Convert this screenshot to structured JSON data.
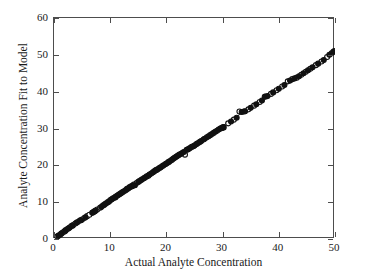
{
  "chart_data": {
    "type": "scatter",
    "title": "",
    "xlabel": "Actual Analyte Concentration",
    "ylabel": "Analyte Concentration Fit to Model",
    "xlim": [
      0,
      50
    ],
    "ylim": [
      0,
      60
    ],
    "xticks": [
      0,
      10,
      20,
      30,
      40,
      50
    ],
    "yticks": [
      0,
      10,
      20,
      30,
      40,
      50,
      60
    ],
    "xtick_labels": [
      "0",
      "10",
      "20",
      "30",
      "40",
      "50"
    ],
    "ytick_labels": [
      "0",
      "10",
      "20",
      "30",
      "40",
      "50",
      "60"
    ],
    "grid": false,
    "legend": "none",
    "tick_direction": "in",
    "frame": "full-box",
    "marker_styles": {
      "open": {
        "shape": "circle",
        "fill": "#ffffff",
        "edge": "#111111",
        "size": 5.0
      },
      "filled": {
        "shape": "circle",
        "fill": "#111111",
        "edge": "#111111",
        "size": 5.0
      }
    },
    "fit_line": {
      "label": "identity fit line",
      "color": "#1a1a1a",
      "width": 0.9,
      "x": [
        0.0,
        50.0
      ],
      "y": [
        0.3,
        51.0
      ]
    },
    "series": [
      {
        "name": "open-circle-observations",
        "marker": "open",
        "points": [
          [
            0.6,
            0.7
          ],
          [
            0.9,
            1.0
          ],
          [
            1.2,
            1.3
          ],
          [
            1.5,
            1.7
          ],
          [
            1.8,
            2.0
          ],
          [
            2.1,
            2.4
          ],
          [
            2.4,
            2.7
          ],
          [
            2.8,
            3.1
          ],
          [
            3.1,
            3.5
          ],
          [
            3.4,
            3.8
          ],
          [
            3.8,
            4.2
          ],
          [
            4.2,
            4.6
          ],
          [
            4.6,
            5.0
          ],
          [
            5.0,
            5.3
          ],
          [
            5.4,
            5.7
          ],
          [
            5.9,
            6.2
          ],
          [
            6.3,
            6.6
          ],
          [
            6.8,
            7.1
          ],
          [
            7.2,
            7.5
          ],
          [
            7.7,
            8.0
          ],
          [
            8.2,
            8.5
          ],
          [
            8.7,
            9.1
          ],
          [
            9.1,
            9.5
          ],
          [
            9.6,
            10.0
          ],
          [
            10.0,
            10.5
          ],
          [
            10.4,
            10.9
          ],
          [
            10.9,
            11.3
          ],
          [
            11.3,
            11.8
          ],
          [
            11.7,
            12.2
          ],
          [
            12.1,
            12.6
          ],
          [
            12.6,
            13.1
          ],
          [
            13.0,
            13.6
          ],
          [
            13.4,
            14.0
          ],
          [
            13.8,
            14.4
          ],
          [
            14.2,
            14.8
          ],
          [
            14.7,
            15.2
          ],
          [
            15.2,
            15.7
          ],
          [
            15.7,
            16.2
          ],
          [
            16.2,
            16.7
          ],
          [
            16.8,
            17.2
          ],
          [
            17.3,
            17.8
          ],
          [
            17.8,
            18.3
          ],
          [
            18.3,
            18.8
          ],
          [
            18.8,
            19.3
          ],
          [
            19.3,
            19.8
          ],
          [
            19.8,
            20.3
          ],
          [
            20.3,
            20.8
          ],
          [
            20.8,
            21.3
          ],
          [
            21.2,
            21.8
          ],
          [
            21.6,
            22.2
          ],
          [
            22.0,
            22.6
          ],
          [
            22.4,
            23.0
          ],
          [
            22.9,
            23.4
          ],
          [
            23.3,
            22.9
          ],
          [
            23.6,
            24.2
          ],
          [
            24.0,
            24.5
          ],
          [
            24.5,
            25.0
          ],
          [
            25.0,
            25.4
          ],
          [
            25.5,
            25.9
          ],
          [
            26.0,
            26.4
          ],
          [
            26.6,
            27.0
          ],
          [
            27.2,
            27.6
          ],
          [
            27.8,
            28.2
          ],
          [
            28.4,
            28.8
          ],
          [
            29.0,
            29.4
          ],
          [
            29.6,
            30.0
          ],
          [
            30.2,
            30.3
          ],
          [
            31.0,
            31.4
          ],
          [
            32.0,
            32.4
          ],
          [
            33.0,
            34.6
          ],
          [
            33.8,
            34.6
          ],
          [
            34.6,
            35.2
          ],
          [
            35.6,
            36.2
          ],
          [
            36.6,
            37.2
          ],
          [
            37.5,
            38.6
          ],
          [
            38.6,
            39.4
          ],
          [
            39.6,
            40.4
          ],
          [
            40.6,
            41.4
          ],
          [
            41.6,
            42.8
          ],
          [
            42.4,
            43.4
          ],
          [
            43.2,
            43.8
          ],
          [
            44.0,
            44.6
          ],
          [
            44.8,
            45.4
          ],
          [
            45.6,
            46.2
          ],
          [
            46.6,
            47.2
          ],
          [
            47.6,
            48.2
          ],
          [
            48.6,
            49.4
          ],
          [
            49.4,
            50.4
          ],
          [
            49.9,
            51.0
          ]
        ]
      },
      {
        "name": "filled-circle-observations",
        "marker": "filled",
        "points": [
          [
            0.8,
            0.9
          ],
          [
            1.3,
            1.5
          ],
          [
            2.0,
            2.2
          ],
          [
            2.6,
            2.9
          ],
          [
            3.3,
            3.6
          ],
          [
            4.0,
            4.4
          ],
          [
            4.8,
            5.1
          ],
          [
            5.6,
            5.9
          ],
          [
            6.9,
            7.2
          ],
          [
            7.1,
            7.4
          ],
          [
            7.4,
            7.7
          ],
          [
            8.4,
            8.7
          ],
          [
            8.9,
            9.2
          ],
          [
            9.3,
            9.7
          ],
          [
            9.8,
            10.2
          ],
          [
            10.2,
            10.7
          ],
          [
            10.6,
            11.1
          ],
          [
            11.0,
            11.5
          ],
          [
            11.5,
            12.0
          ],
          [
            11.9,
            12.4
          ],
          [
            12.3,
            12.8
          ],
          [
            12.8,
            13.3
          ],
          [
            13.2,
            13.7
          ],
          [
            13.5,
            14.1
          ],
          [
            13.9,
            14.3
          ],
          [
            14.1,
            14.5
          ],
          [
            14.4,
            14.6
          ],
          [
            15.0,
            15.5
          ],
          [
            15.5,
            16.0
          ],
          [
            16.0,
            16.5
          ],
          [
            16.5,
            17.0
          ],
          [
            17.0,
            17.5
          ],
          [
            17.6,
            18.1
          ],
          [
            18.0,
            18.6
          ],
          [
            18.2,
            18.7
          ],
          [
            18.5,
            19.0
          ],
          [
            19.0,
            19.5
          ],
          [
            19.5,
            20.0
          ],
          [
            20.0,
            20.5
          ],
          [
            20.5,
            21.0
          ],
          [
            21.0,
            21.5
          ],
          [
            21.4,
            22.0
          ],
          [
            21.8,
            22.4
          ],
          [
            22.2,
            22.8
          ],
          [
            22.7,
            23.2
          ],
          [
            23.1,
            23.6
          ],
          [
            23.8,
            24.3
          ],
          [
            24.2,
            24.7
          ],
          [
            24.8,
            25.2
          ],
          [
            25.3,
            25.7
          ],
          [
            25.8,
            26.2
          ],
          [
            26.2,
            26.6
          ],
          [
            26.8,
            27.2
          ],
          [
            27.5,
            27.9
          ],
          [
            28.1,
            28.5
          ],
          [
            28.7,
            29.1
          ],
          [
            29.3,
            29.7
          ],
          [
            29.8,
            30.1
          ],
          [
            30.0,
            30.2
          ],
          [
            30.1,
            30.4
          ],
          [
            31.5,
            31.9
          ],
          [
            32.5,
            32.9
          ],
          [
            33.4,
            34.5
          ],
          [
            34.0,
            34.7
          ],
          [
            35.0,
            35.6
          ],
          [
            36.0,
            36.6
          ],
          [
            37.0,
            37.6
          ],
          [
            37.6,
            38.7
          ],
          [
            38.0,
            38.8
          ],
          [
            39.0,
            39.8
          ],
          [
            40.0,
            40.8
          ],
          [
            41.0,
            41.8
          ],
          [
            42.0,
            43.0
          ],
          [
            42.8,
            43.6
          ],
          [
            43.6,
            44.2
          ],
          [
            44.4,
            45.0
          ],
          [
            45.2,
            45.8
          ],
          [
            46.0,
            46.6
          ],
          [
            47.0,
            47.6
          ],
          [
            48.0,
            48.6
          ],
          [
            49.0,
            50.0
          ],
          [
            49.7,
            50.8
          ]
        ]
      }
    ]
  }
}
